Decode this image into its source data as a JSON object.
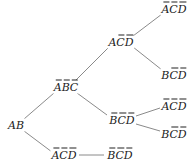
{
  "diagram": {
    "type": "tree",
    "nodes": [
      {
        "id": "n_ab",
        "label": "AB",
        "literals": [
          {
            "v": "A",
            "neg": false
          },
          {
            "v": "B",
            "neg": false
          }
        ],
        "x": 16,
        "y": 125
      },
      {
        "id": "n_abc",
        "label": "ĀB̄C̄",
        "literals": [
          {
            "v": "A",
            "neg": true
          },
          {
            "v": "B",
            "neg": true
          },
          {
            "v": "C",
            "neg": true
          }
        ],
        "x": 66,
        "y": 87
      },
      {
        "id": "n_acd",
        "label": "AC̄D̄",
        "literals": [
          {
            "v": "A",
            "neg": false
          },
          {
            "v": "C",
            "neg": true
          },
          {
            "v": "D",
            "neg": true
          }
        ],
        "x": 121,
        "y": 42
      },
      {
        "id": "n_acd_top",
        "label": "ĀC̄D̄",
        "literals": [
          {
            "v": "A",
            "neg": true
          },
          {
            "v": "C",
            "neg": true
          },
          {
            "v": "D",
            "neg": true
          }
        ],
        "x": 174,
        "y": 9
      },
      {
        "id": "n_bcd_up",
        "label": "BC̄D̄",
        "literals": [
          {
            "v": "B",
            "neg": false
          },
          {
            "v": "C",
            "neg": true
          },
          {
            "v": "D",
            "neg": true
          }
        ],
        "x": 174,
        "y": 75
      },
      {
        "id": "n_bcd_mid",
        "label": "B̄C̄D̄",
        "literals": [
          {
            "v": "B",
            "neg": true
          },
          {
            "v": "C",
            "neg": true
          },
          {
            "v": "D",
            "neg": true
          }
        ],
        "x": 122,
        "y": 120
      },
      {
        "id": "n_acd_mid",
        "label": "ĀC̄D̄",
        "literals": [
          {
            "v": "A",
            "neg": true
          },
          {
            "v": "C",
            "neg": true
          },
          {
            "v": "D",
            "neg": true
          }
        ],
        "x": 174,
        "y": 106
      },
      {
        "id": "n_bcd_low",
        "label": "BC̄D̄",
        "literals": [
          {
            "v": "B",
            "neg": false
          },
          {
            "v": "C",
            "neg": true
          },
          {
            "v": "D",
            "neg": true
          }
        ],
        "x": 174,
        "y": 134
      },
      {
        "id": "n_acd_bot",
        "label": "ĀC̄D̄",
        "literals": [
          {
            "v": "A",
            "neg": true
          },
          {
            "v": "C",
            "neg": true
          },
          {
            "v": "D",
            "neg": true
          }
        ],
        "x": 64,
        "y": 155
      },
      {
        "id": "n_bcd_bot",
        "label": "B̄C̄D̄",
        "literals": [
          {
            "v": "B",
            "neg": true
          },
          {
            "v": "C",
            "neg": true
          },
          {
            "v": "D",
            "neg": true
          }
        ],
        "x": 120,
        "y": 155
      }
    ],
    "edges": [
      {
        "from": "n_ab",
        "to": "n_abc",
        "x1": 24,
        "y1": 119,
        "x2": 54,
        "y2": 93
      },
      {
        "from": "n_ab",
        "to": "n_acd_bot",
        "x1": 24,
        "y1": 131,
        "x2": 52,
        "y2": 152
      },
      {
        "from": "n_abc",
        "to": "n_acd",
        "x1": 76,
        "y1": 80,
        "x2": 109,
        "y2": 47
      },
      {
        "from": "n_abc",
        "to": "n_bcd_mid",
        "x1": 77,
        "y1": 93,
        "x2": 107,
        "y2": 115
      },
      {
        "from": "n_acd",
        "to": "n_acd_top",
        "x1": 133,
        "y1": 36,
        "x2": 162,
        "y2": 14
      },
      {
        "from": "n_acd",
        "to": "n_bcd_up",
        "x1": 133,
        "y1": 47,
        "x2": 162,
        "y2": 70
      },
      {
        "from": "n_bcd_mid",
        "to": "n_acd_mid",
        "x1": 136,
        "y1": 116,
        "x2": 160,
        "y2": 108
      },
      {
        "from": "n_bcd_mid",
        "to": "n_bcd_low",
        "x1": 136,
        "y1": 124,
        "x2": 160,
        "y2": 131
      },
      {
        "from": "n_acd_bot",
        "to": "n_bcd_bot",
        "x1": 79,
        "y1": 155,
        "x2": 104,
        "y2": 155
      }
    ]
  }
}
